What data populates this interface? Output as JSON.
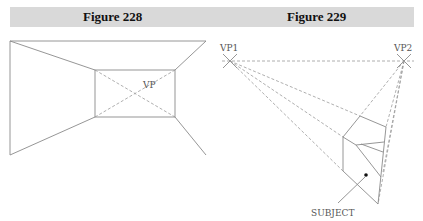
{
  "header": {
    "figures": [
      {
        "label": "Figure 228"
      },
      {
        "label": "Figure 229"
      }
    ]
  },
  "figure_228": {
    "vanishing_point_label": "VP",
    "description": "One-point perspective room: outer frame converging to inner back wall rectangle, diagonals meeting at VP"
  },
  "figure_229": {
    "vp1_label": "VP1",
    "vp2_label": "VP2",
    "subject_label": "SUBJECT",
    "description": "Two-point perspective: horizon line between VP1 and VP2 with dashed projection lines to a subject object"
  },
  "colors": {
    "header_band": "#d9d9d9",
    "line": "#8a8a8a",
    "subject_dot": "#111111"
  }
}
